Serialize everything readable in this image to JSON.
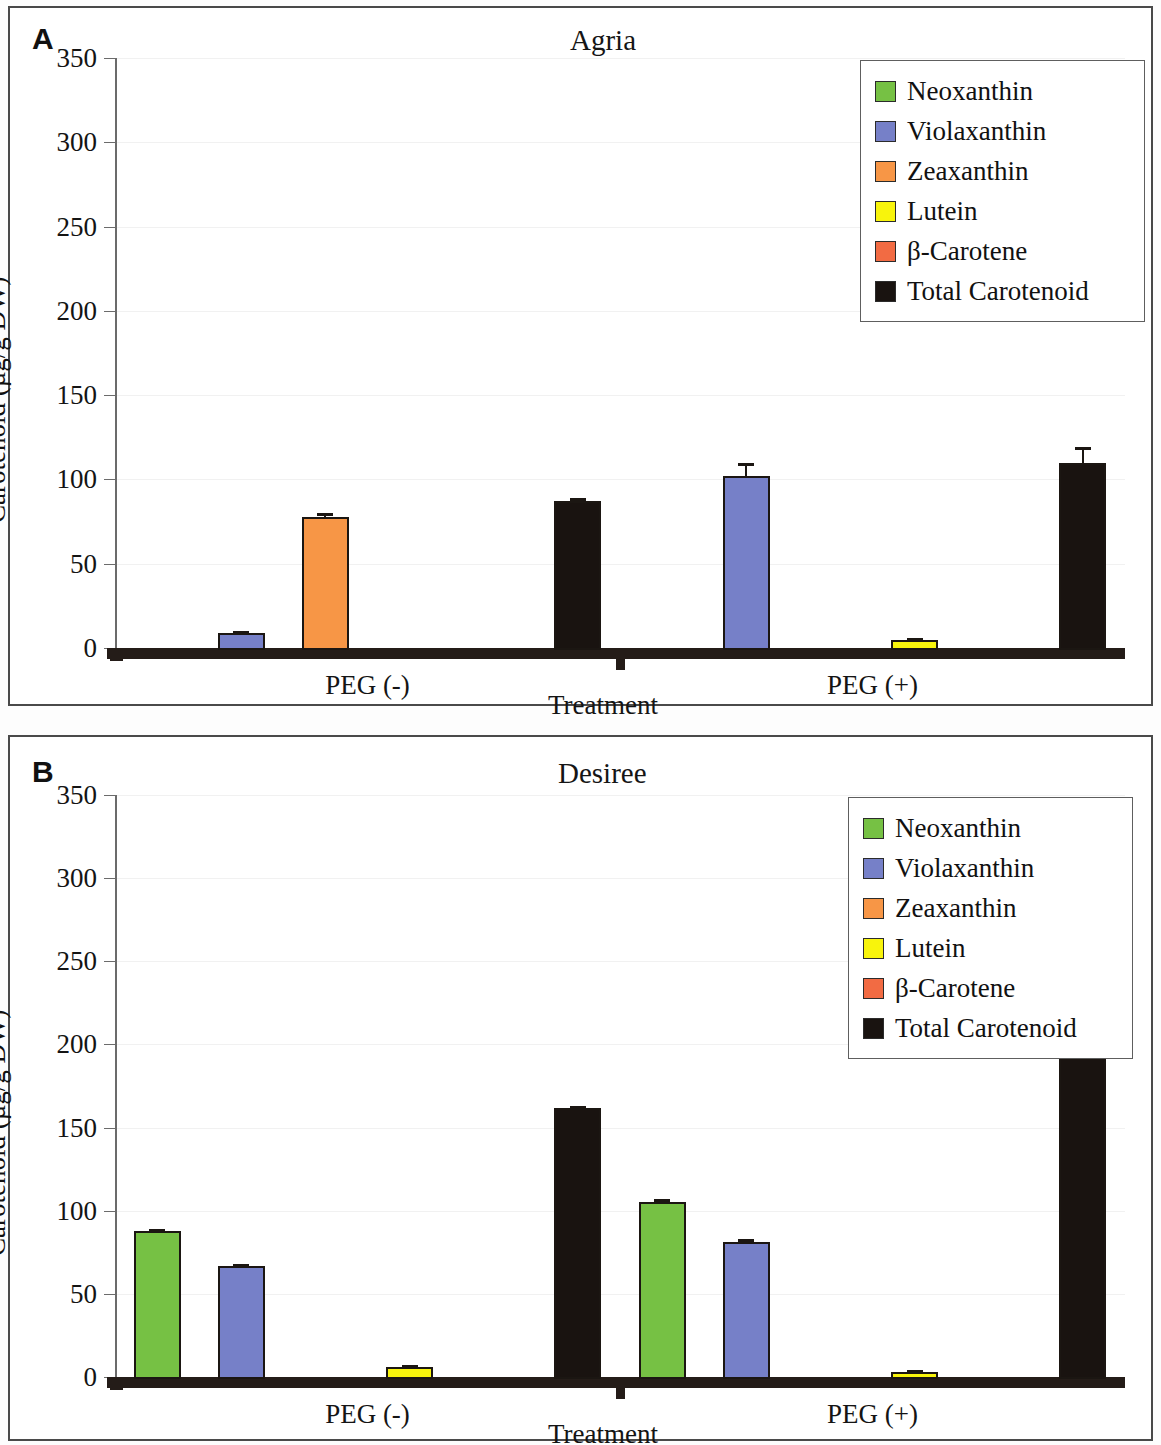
{
  "figure": {
    "y_axis_title": "Carotenoid (µg/g DW)",
    "x_axis_title": "Treatment",
    "group_labels": [
      "PEG (-)",
      "PEG (+)"
    ],
    "tick_labels": [
      "0",
      "50",
      "100",
      "150",
      "200",
      "250",
      "300",
      "350"
    ]
  },
  "panels": [
    {
      "letter": "A",
      "title": "Agria"
    },
    {
      "letter": "B",
      "title": "Desiree"
    }
  ],
  "legend": {
    "entries": [
      {
        "label": "Neoxanthin",
        "color": "#76c144"
      },
      {
        "label": "Violaxanthin",
        "color": "#7680c8"
      },
      {
        "label": "Zeaxanthin",
        "color": "#f79646"
      },
      {
        "label": "Lutein",
        "color": "#f8f40c"
      },
      {
        "label": "β-Carotene",
        "color": "#f26b43"
      },
      {
        "label": "Total Carotenoid",
        "color": "#191310"
      }
    ]
  },
  "chart_data": [
    {
      "type": "bar",
      "title": "Agria",
      "panel": "A",
      "xlabel": "Treatment",
      "ylabel": "Carotenoid (µg/g DW)",
      "ylim": [
        0,
        350
      ],
      "yticks": [
        0,
        50,
        100,
        150,
        200,
        250,
        300,
        350
      ],
      "grid": true,
      "legend_position": "top-right",
      "categories": [
        "PEG (-)",
        "PEG (+)"
      ],
      "series": [
        {
          "name": "Neoxanthin",
          "color": "#76c144",
          "values": [
            0,
            0
          ],
          "errors": [
            0,
            0
          ]
        },
        {
          "name": "Violaxanthin",
          "color": "#7680c8",
          "values": [
            9,
            102
          ],
          "errors": [
            1,
            8
          ]
        },
        {
          "name": "Zeaxanthin",
          "color": "#f79646",
          "values": [
            78,
            0
          ],
          "errors": [
            2,
            0
          ]
        },
        {
          "name": "Lutein",
          "color": "#f8f40c",
          "values": [
            0,
            5
          ],
          "errors": [
            0,
            1
          ]
        },
        {
          "name": "β-Carotene",
          "color": "#f26b43",
          "values": [
            0,
            0
          ],
          "errors": [
            0,
            0
          ]
        },
        {
          "name": "Total Carotenoid",
          "color": "#191310",
          "values": [
            87,
            110
          ],
          "errors": [
            2,
            9
          ]
        }
      ]
    },
    {
      "type": "bar",
      "title": "Desiree",
      "panel": "B",
      "xlabel": "Treatment",
      "ylabel": "Carotenoid (µg/g DW)",
      "ylim": [
        0,
        350
      ],
      "yticks": [
        0,
        50,
        100,
        150,
        200,
        250,
        300,
        350
      ],
      "grid": true,
      "legend_position": "top-right",
      "categories": [
        "PEG (-)",
        "PEG (+)"
      ],
      "series": [
        {
          "name": "Neoxanthin",
          "color": "#76c144",
          "values": [
            88,
            105
          ],
          "errors": [
            1,
            2
          ]
        },
        {
          "name": "Violaxanthin",
          "color": "#7680c8",
          "values": [
            67,
            81
          ],
          "errors": [
            1,
            2
          ]
        },
        {
          "name": "Zeaxanthin",
          "color": "#f79646",
          "values": [
            0,
            0
          ],
          "errors": [
            0,
            0
          ]
        },
        {
          "name": "Lutein",
          "color": "#f8f40c",
          "values": [
            6,
            3
          ],
          "errors": [
            1,
            1
          ]
        },
        {
          "name": "β-Carotene",
          "color": "#f26b43",
          "values": [
            0,
            0
          ],
          "errors": [
            0,
            0
          ]
        },
        {
          "name": "Total Carotenoid",
          "color": "#191310",
          "values": [
            162,
            192
          ],
          "errors": [
            1,
            3
          ]
        }
      ]
    }
  ]
}
